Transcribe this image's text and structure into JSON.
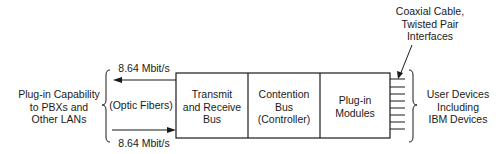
{
  "diagram": {
    "left_label": [
      "Plug-in Capability",
      "to PBXs and",
      "Other LANs"
    ],
    "top_rate": "8.64 Mbit/s",
    "bottom_rate": "8.64 Mbit/s",
    "medium": "(Optic Fibers)",
    "boxes": [
      {
        "lines": [
          "Transmit",
          "and Receive",
          "Bus"
        ]
      },
      {
        "lines": [
          "Contention",
          "Bus",
          "(Controller)"
        ]
      },
      {
        "lines": [
          "Plug-in",
          "Modules"
        ]
      }
    ],
    "interface_label": [
      "Coaxial Cable,",
      "Twisted Pair",
      "Interfaces"
    ],
    "right_label": [
      "User Devices",
      "Including",
      "IBM Devices"
    ],
    "stub_count": 8
  }
}
